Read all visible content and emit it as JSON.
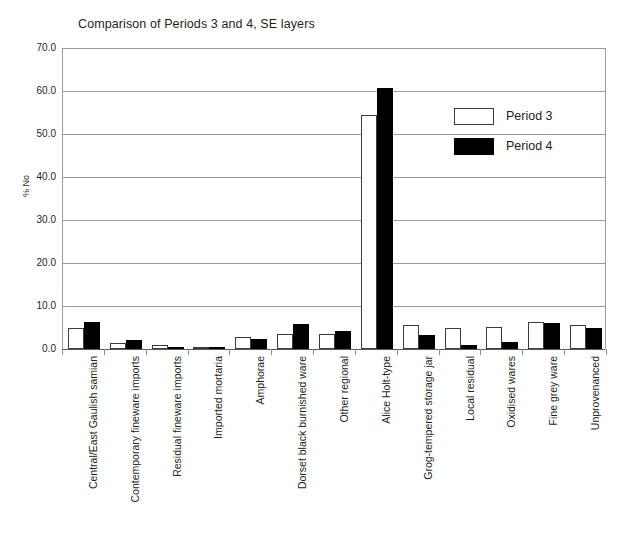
{
  "chart_data": {
    "type": "bar",
    "title": "Comparison  of Periods 3 and 4, SE layers",
    "xlabel": "",
    "ylabel": "% No",
    "ylim": [
      0,
      70
    ],
    "ytick_labels": [
      "70.0",
      "60.0",
      "50.0",
      "40.0",
      "30.0",
      "20.0",
      "10.0",
      "0.0"
    ],
    "ytick_values": [
      70,
      60,
      50,
      40,
      30,
      20,
      10,
      0
    ],
    "grid": true,
    "legend_position": "upper right",
    "categories": [
      "Central/East Gaulish samian",
      "Contemporary fineware imports",
      "Residual fineware imports",
      "Imported mortaria",
      "Amphorae",
      "Dorset black burnished ware",
      "Other regional",
      "Alice Holt-type",
      "Grog-tempered storage jar",
      "Local residual",
      "Oxidised wares",
      "Fine grey ware",
      "Unprovenanced"
    ],
    "series": [
      {
        "name": "Period 3",
        "color": "#ffffff",
        "edge_color": "#3b3b3b",
        "values": [
          5.0,
          1.3,
          1.0,
          0.2,
          2.8,
          3.4,
          3.4,
          54.5,
          5.7,
          5.0,
          5.2,
          6.2,
          5.7
        ]
      },
      {
        "name": "Period 4",
        "color": "#000000",
        "edge_color": "#000000",
        "values": [
          6.2,
          2.1,
          0.5,
          0.1,
          2.3,
          5.9,
          4.2,
          60.7,
          3.3,
          1.0,
          1.7,
          6.0,
          4.9
        ]
      }
    ]
  },
  "legend": {
    "items": [
      {
        "label": "Period 3"
      },
      {
        "label": "Period 4"
      }
    ]
  }
}
